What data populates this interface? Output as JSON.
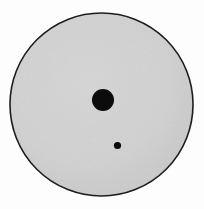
{
  "figure": {
    "title": "Gray disk with two dark circular spots",
    "background_color": "#fdfdfd",
    "width": 204,
    "height": 209,
    "shapes": {
      "main_disk": {
        "name": "large gray disk",
        "cx": 101.5,
        "cy": 104.5,
        "r": 91.5,
        "fill": "#d0d0d0",
        "stroke": "#1a1a1a",
        "stroke_width": 1.6
      },
      "large_spot": {
        "name": "large dark spot",
        "cx": 103,
        "cy": 100,
        "r": 11,
        "fill": "#0c0c0c"
      },
      "small_spot": {
        "name": "small dark spot",
        "cx": 117.5,
        "cy": 145.5,
        "r": 3.6,
        "fill": "#0c0c0c"
      }
    },
    "colors": {
      "disk_fill": "#d0d0d0",
      "disk_outline": "#1a1a1a",
      "spot_fill": "#0c0c0c",
      "page_background": "#fdfdfd"
    }
  }
}
